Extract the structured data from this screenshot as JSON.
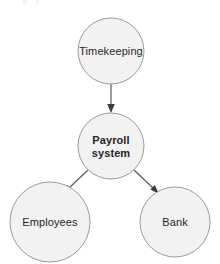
{
  "diagram": {
    "background_color": "#ffffff",
    "node_fill_color": "#f2f2f2",
    "node_stroke_color": "#9a9a9a",
    "edge_color": "#3c3c3c",
    "text_color": "#262626",
    "top_edge_artifact": "g  y",
    "nodes": [
      {
        "id": "timekeeping",
        "label": "Timekeeping",
        "label_lines": [
          "Timekeeping"
        ],
        "bold": false,
        "cx": 111,
        "cy": 51,
        "r": 33
      },
      {
        "id": "payroll-system",
        "label": "Payroll system",
        "label_lines": [
          "Payroll",
          "system"
        ],
        "bold": true,
        "cx": 111,
        "cy": 146,
        "r": 33
      },
      {
        "id": "employees",
        "label": "Employees",
        "label_lines": [
          "Employees"
        ],
        "bold": false,
        "cx": 50,
        "cy": 222,
        "r": 40
      },
      {
        "id": "bank",
        "label": "Bank",
        "label_lines": [
          "Bank"
        ],
        "bold": false,
        "cx": 175,
        "cy": 222,
        "r": 35
      }
    ],
    "edges": [
      {
        "id": "timekeeping-to-payroll",
        "from": "timekeeping",
        "to": "payroll-system",
        "direction": "down",
        "arrowhead": "filled"
      },
      {
        "id": "payroll-to-employees",
        "from": "payroll-system",
        "to": "employees",
        "direction": "down-left",
        "arrowhead": "filled"
      },
      {
        "id": "payroll-to-bank",
        "from": "payroll-system",
        "to": "bank",
        "direction": "down-right",
        "arrowhead": "filled"
      }
    ]
  }
}
